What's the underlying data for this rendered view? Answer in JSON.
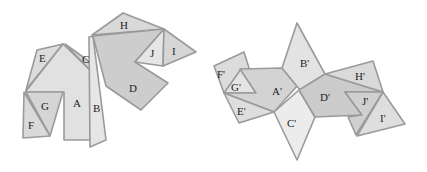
{
  "colors": {
    "background": "#ffffff",
    "fill_light": "#e2e2e2",
    "fill_mid": "#d3d3d3",
    "fill_dark": "#c6c6c6",
    "fill_pale": "#ececec",
    "edge": "#9a9a9a",
    "label": "#222222"
  },
  "figures": [
    {
      "name": "original",
      "pieces": [
        {
          "label": "E",
          "points": "37,50 63,44 26,90",
          "fill": "#dcdcdc",
          "lx": 39,
          "ly": 62
        },
        {
          "label": "A",
          "points": "26,91 63,44 90,70 90,140 64,140 64,92 26,92",
          "fill": "#e1e1e1",
          "lx": 73,
          "ly": 107
        },
        {
          "label": "C",
          "points": "65,44 90,62 90,70",
          "fill": "#d8d8d8",
          "lx": 82,
          "ly": 63
        },
        {
          "label": "G",
          "points": "26,92 63,92 50,136",
          "fill": "#d5d5d5",
          "lx": 41,
          "ly": 110
        },
        {
          "label": "F",
          "points": "24,92 50,136 23,138",
          "fill": "#dadada",
          "lx": 28,
          "ly": 129
        },
        {
          "label": "B",
          "points": "89,37 93,36 106,140 90,147",
          "fill": "#e6e6e6",
          "lx": 93,
          "ly": 112
        },
        {
          "label": "H",
          "points": "92,35 123,13 164,29",
          "fill": "#d9d9d9",
          "lx": 120,
          "ly": 29
        },
        {
          "label": "D",
          "points": "93,36 164,29 135,62 168,83 141,110 106,86",
          "fill": "#cdcdcd",
          "lx": 129,
          "ly": 92
        },
        {
          "label": "J",
          "points": "164,29 135,62 163,66",
          "fill": "#e6e6e6",
          "lx": 150,
          "ly": 57
        },
        {
          "label": "I",
          "points": "164,29 163,66 196,52",
          "fill": "#d6d6d6",
          "lx": 172,
          "ly": 55
        }
      ]
    },
    {
      "name": "transformed",
      "pieces": [
        {
          "label": "F'",
          "points": "214,66 244,52 249,68 224,93",
          "fill": "#dcdcdc",
          "lx": 217,
          "ly": 78
        },
        {
          "label": "G'",
          "points": "241,69 256,93 224,93",
          "fill": "#e4e4e4",
          "lx": 231,
          "ly": 91
        },
        {
          "label": "A'",
          "points": "240,69 282,68 297,86 274,112 224,93 256,93",
          "fill": "#d3d3d3",
          "lx": 272,
          "ly": 95
        },
        {
          "label": "E'",
          "points": "224,93 274,112 239,123",
          "fill": "#dedede",
          "lx": 237,
          "ly": 115
        },
        {
          "label": "B'",
          "points": "282,68 297,23 325,74 300,90",
          "fill": "#e3e3e3",
          "lx": 300,
          "ly": 67
        },
        {
          "label": "C'",
          "points": "274,112 299,90 315,117 297,160",
          "fill": "#ececec",
          "lx": 287,
          "ly": 127
        },
        {
          "label": "D'",
          "points": "299,90 325,74 383,92 345,92 362,115 315,117",
          "fill": "#cbcbcb",
          "lx": 320,
          "ly": 101
        },
        {
          "label": "H'",
          "points": "325,74 373,61 383,92",
          "fill": "#dadada",
          "lx": 355,
          "ly": 80
        },
        {
          "label": "J'",
          "points": "345,92 383,92 356,135 348,117 362,115",
          "fill": "#d0d0d0",
          "lx": 362,
          "ly": 105
        },
        {
          "label": "I'",
          "points": "383,92 405,124 357,136",
          "fill": "#dedede",
          "lx": 380,
          "ly": 122
        }
      ]
    }
  ]
}
